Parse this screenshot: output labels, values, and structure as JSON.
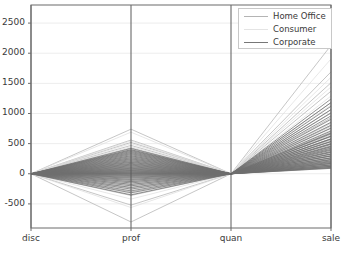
{
  "chart_data": {
    "type": "line",
    "plot_kind": "parallel-coordinates",
    "title": "",
    "xlabel": "",
    "ylabel": "",
    "grid": true,
    "legend_position": "upper right",
    "axes": [
      "disc",
      "prof",
      "quan",
      "sale"
    ],
    "categories": [
      "disc",
      "prof",
      "quan",
      "sale"
    ],
    "ylim": [
      -900,
      2800
    ],
    "yticks": [
      -500,
      0,
      500,
      1000,
      1500,
      2000,
      2500
    ],
    "ytick_labels": [
      "-500",
      "0",
      "500",
      "1000",
      "1500",
      "2000",
      "2500"
    ],
    "xtick_labels": [
      "disc",
      "prof",
      "quan",
      "sale"
    ],
    "legend": [
      {
        "name": "Home Office",
        "color": "#b4b4b4"
      },
      {
        "name": "Consumer",
        "color": "#e4e4e4"
      },
      {
        "name": "Corporate",
        "color": "#777777"
      }
    ],
    "series": [
      {
        "name": "Home Office",
        "color": "#b4b4b4",
        "lines": [
          [
            0,
            740,
            0,
            2130
          ],
          [
            0,
            560,
            0,
            1690
          ],
          [
            0,
            520,
            0,
            1510
          ],
          [
            0,
            470,
            0,
            1370
          ],
          [
            0,
            430,
            0,
            1180
          ],
          [
            0,
            395,
            0,
            1060
          ],
          [
            0,
            360,
            0,
            930
          ],
          [
            0,
            330,
            0,
            840
          ],
          [
            0,
            300,
            0,
            760
          ],
          [
            0,
            270,
            0,
            690
          ],
          [
            0,
            245,
            0,
            620
          ],
          [
            0,
            215,
            0,
            560
          ],
          [
            0,
            190,
            0,
            505
          ],
          [
            0,
            165,
            0,
            450
          ],
          [
            0,
            140,
            0,
            400
          ],
          [
            0,
            115,
            0,
            350
          ],
          [
            0,
            95,
            0,
            305
          ],
          [
            0,
            72,
            0,
            260
          ],
          [
            0,
            52,
            0,
            215
          ],
          [
            0,
            33,
            0,
            175
          ],
          [
            0,
            16,
            0,
            135
          ],
          [
            0,
            5,
            0,
            95
          ],
          [
            0,
            -14,
            0,
            120
          ],
          [
            0,
            -38,
            0,
            180
          ],
          [
            0,
            -66,
            0,
            240
          ],
          [
            0,
            -98,
            0,
            300
          ],
          [
            0,
            -135,
            0,
            365
          ],
          [
            0,
            -180,
            0,
            430
          ],
          [
            0,
            -235,
            0,
            500
          ],
          [
            0,
            -300,
            0,
            575
          ],
          [
            0,
            -360,
            0,
            650
          ],
          [
            0,
            -520,
            0,
            790
          ],
          [
            0,
            -800,
            0,
            1005
          ]
        ]
      },
      {
        "name": "Consumer",
        "color": "#e0e0e0",
        "lines": [
          [
            0,
            690,
            0,
            1905
          ],
          [
            0,
            545,
            0,
            1600
          ],
          [
            0,
            500,
            0,
            1440
          ],
          [
            0,
            450,
            0,
            1290
          ],
          [
            0,
            410,
            0,
            1140
          ],
          [
            0,
            375,
            0,
            1010
          ],
          [
            0,
            345,
            0,
            895
          ],
          [
            0,
            315,
            0,
            805
          ],
          [
            0,
            288,
            0,
            725
          ],
          [
            0,
            258,
            0,
            655
          ],
          [
            0,
            232,
            0,
            590
          ],
          [
            0,
            205,
            0,
            530
          ],
          [
            0,
            180,
            0,
            478
          ],
          [
            0,
            155,
            0,
            425
          ],
          [
            0,
            130,
            0,
            375
          ],
          [
            0,
            108,
            0,
            328
          ],
          [
            0,
            86,
            0,
            282
          ],
          [
            0,
            64,
            0,
            238
          ],
          [
            0,
            44,
            0,
            196
          ],
          [
            0,
            26,
            0,
            156
          ],
          [
            0,
            10,
            0,
            118
          ],
          [
            0,
            -5,
            0,
            88
          ],
          [
            0,
            -24,
            0,
            145
          ],
          [
            0,
            -50,
            0,
            208
          ],
          [
            0,
            -80,
            0,
            270
          ],
          [
            0,
            -115,
            0,
            335
          ],
          [
            0,
            -155,
            0,
            400
          ],
          [
            0,
            -205,
            0,
            468
          ],
          [
            0,
            -265,
            0,
            540
          ],
          [
            0,
            -330,
            0,
            615
          ],
          [
            0,
            -420,
            0,
            705
          ],
          [
            0,
            -560,
            0,
            845
          ]
        ]
      },
      {
        "name": "Corporate",
        "color": "#6e6e6e",
        "lines": [
          [
            0,
            420,
            0,
            1240
          ],
          [
            0,
            400,
            0,
            1180
          ],
          [
            0,
            385,
            0,
            1120
          ],
          [
            0,
            370,
            0,
            1065
          ],
          [
            0,
            352,
            0,
            1010
          ],
          [
            0,
            336,
            0,
            960
          ],
          [
            0,
            318,
            0,
            905
          ],
          [
            0,
            300,
            0,
            855
          ],
          [
            0,
            284,
            0,
            805
          ],
          [
            0,
            266,
            0,
            755
          ],
          [
            0,
            250,
            0,
            710
          ],
          [
            0,
            234,
            0,
            665
          ],
          [
            0,
            218,
            0,
            620
          ],
          [
            0,
            202,
            0,
            578
          ],
          [
            0,
            188,
            0,
            538
          ],
          [
            0,
            172,
            0,
            498
          ],
          [
            0,
            158,
            0,
            460
          ],
          [
            0,
            144,
            0,
            424
          ],
          [
            0,
            130,
            0,
            390
          ],
          [
            0,
            116,
            0,
            356
          ],
          [
            0,
            103,
            0,
            324
          ],
          [
            0,
            90,
            0,
            294
          ],
          [
            0,
            78,
            0,
            265
          ],
          [
            0,
            66,
            0,
            238
          ],
          [
            0,
            55,
            0,
            212
          ],
          [
            0,
            44,
            0,
            188
          ],
          [
            0,
            34,
            0,
            165
          ],
          [
            0,
            24,
            0,
            144
          ],
          [
            0,
            15,
            0,
            124
          ],
          [
            0,
            7,
            0,
            106
          ],
          [
            0,
            0,
            0,
            90
          ],
          [
            0,
            -8,
            0,
            100
          ],
          [
            0,
            -18,
            0,
            122
          ],
          [
            0,
            -30,
            0,
            146
          ],
          [
            0,
            -44,
            0,
            172
          ],
          [
            0,
            -58,
            0,
            200
          ],
          [
            0,
            -74,
            0,
            230
          ],
          [
            0,
            -92,
            0,
            262
          ],
          [
            0,
            -110,
            0,
            295
          ],
          [
            0,
            -130,
            0,
            330
          ],
          [
            0,
            -152,
            0,
            368
          ],
          [
            0,
            -175,
            0,
            406
          ],
          [
            0,
            -200,
            0,
            446
          ],
          [
            0,
            -226,
            0,
            488
          ],
          [
            0,
            -254,
            0,
            532
          ],
          [
            0,
            -284,
            0,
            578
          ],
          [
            0,
            -316,
            0,
            626
          ],
          [
            0,
            -350,
            0,
            676
          ]
        ]
      }
    ]
  }
}
